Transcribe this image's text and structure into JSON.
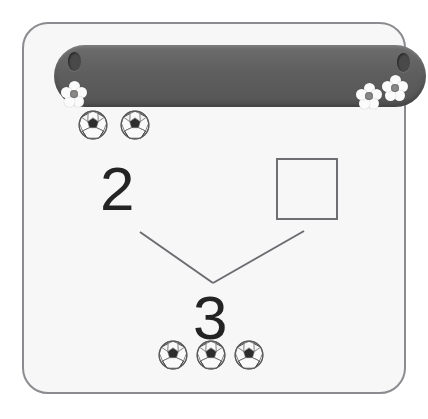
{
  "worksheet": {
    "frame": {
      "border_color": "#8c8c90",
      "background_color": "#f7f7f8"
    },
    "banner": {
      "name": "decorative-header-banner",
      "color": "#5f5e5e",
      "eyelets": 2,
      "flowers": 3
    },
    "problem": {
      "type": "number-bond-addition",
      "addend_known": "2",
      "addend_missing": "",
      "total": "3",
      "top_group_count": 3,
      "top_group_shown": 2,
      "bottom_group_count": 3,
      "item_icon": "soccer-ball-icon",
      "answer_box_value": ""
    },
    "objects": {
      "top_balls": [
        "soccer-ball-icon",
        "soccer-ball-icon"
      ],
      "bottom_balls": [
        "soccer-ball-icon",
        "soccer-ball-icon",
        "soccer-ball-icon"
      ]
    },
    "connectors": [
      {
        "name": "left-branch",
        "from_x": 140,
        "from_y": 232,
        "to_x": 213,
        "to_y": 283
      },
      {
        "name": "right-branch",
        "from_x": 304,
        "from_y": 231,
        "to_x": 213,
        "to_y": 283
      }
    ],
    "colors": {
      "digit": "#242424",
      "box_border": "#6f6f73",
      "line": "#6b6b70",
      "flower_petal": "#fbfbfb",
      "flower_core": "#8a8988"
    }
  }
}
